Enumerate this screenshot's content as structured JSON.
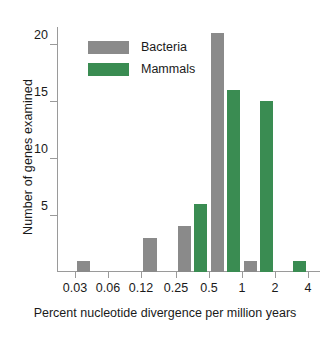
{
  "chart_data": {
    "type": "bar",
    "title": "",
    "subtitle": "",
    "xlabel": "Percent nucleotide divergence per million years",
    "ylabel": "Number of genes examined",
    "xscale": "log2",
    "x_tick_labels": [
      "0.03",
      "0.06",
      "0.12",
      "0.25",
      "0.5",
      "1",
      "2",
      "4"
    ],
    "x_tick_values": [
      0.03,
      0.06,
      0.12,
      0.25,
      0.5,
      1,
      2,
      4
    ],
    "y_tick_labels": [
      "5",
      "10",
      "15",
      "20"
    ],
    "y_tick_values": [
      5,
      10,
      15,
      20
    ],
    "ylim": [
      0,
      21.5
    ],
    "grid": false,
    "legend_position": "upper-left-inside",
    "categories": [
      "0.03-0.06",
      "0.06-0.12",
      "0.12-0.25",
      "0.25-0.5",
      "0.5-1",
      "1-2",
      "2-4"
    ],
    "series": [
      {
        "name": "Bacteria",
        "color": "#8a8a8a",
        "values": [
          1,
          0,
          3,
          4,
          21,
          1,
          0
        ]
      },
      {
        "name": "Mammals",
        "color": "#3a8c52",
        "values": [
          0,
          0,
          0,
          6,
          16,
          15,
          1
        ]
      }
    ]
  },
  "legend": {
    "items": [
      {
        "label": "Bacteria",
        "color": "#8a8a8a"
      },
      {
        "label": "Mammals",
        "color": "#3a8c52"
      }
    ]
  },
  "axes": {
    "y_title": "Number of genes examined",
    "x_title": "Percent nucleotide divergence per million years"
  }
}
